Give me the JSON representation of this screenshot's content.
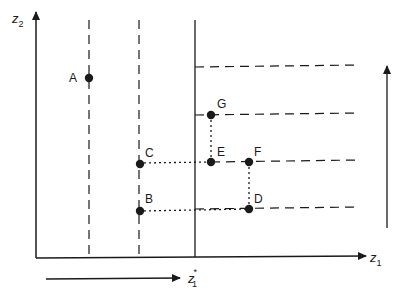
{
  "diagram": {
    "axes": {
      "x_label": "z",
      "x_label_sub": "1",
      "y_label": "z",
      "y_label_sub": "2"
    },
    "threshold_label": "z",
    "threshold_label_sub": "1",
    "threshold_label_sup": "*",
    "points": [
      {
        "id": "A",
        "label": "A"
      },
      {
        "id": "B",
        "label": "B"
      },
      {
        "id": "C",
        "label": "C"
      },
      {
        "id": "D",
        "label": "D"
      },
      {
        "id": "E",
        "label": "E"
      },
      {
        "id": "F",
        "label": "F"
      },
      {
        "id": "G",
        "label": "G"
      }
    ],
    "colors": {
      "ink": "#1a1a1a",
      "background": "#ffffff"
    }
  }
}
